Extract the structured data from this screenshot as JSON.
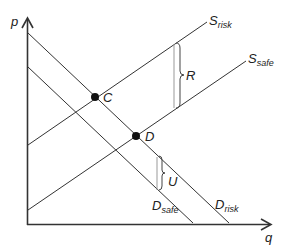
{
  "axes": {
    "y_label": "p",
    "x_label": "q"
  },
  "curves": [
    {
      "id": "S_risk",
      "label_main": "S",
      "label_sub": "risk",
      "x1": 28,
      "y1": 145,
      "x2": 207,
      "y2": 22
    },
    {
      "id": "S_safe",
      "label_main": "S",
      "label_sub": "safe",
      "x1": 28,
      "y1": 210,
      "x2": 246,
      "y2": 61
    },
    {
      "id": "D_risk",
      "label_main": "D",
      "label_sub": "risk",
      "x1": 28,
      "y1": 33,
      "x2": 229,
      "y2": 223
    },
    {
      "id": "D_safe",
      "label_main": "D",
      "label_sub": "safe",
      "x1": 28,
      "y1": 67,
      "x2": 193,
      "y2": 223
    }
  ],
  "points": [
    {
      "label": "C",
      "x": 95,
      "y": 97
    },
    {
      "label": "D",
      "x": 136,
      "y": 136
    }
  ],
  "brackets": [
    {
      "label": "R",
      "x": 175,
      "y_top": 43,
      "y_bottom": 108
    },
    {
      "label": "U",
      "x": 158,
      "y_top": 157,
      "y_bottom": 190
    }
  ],
  "colors": {
    "line": "#333333",
    "point": "#111111",
    "bracket": "#555555"
  }
}
